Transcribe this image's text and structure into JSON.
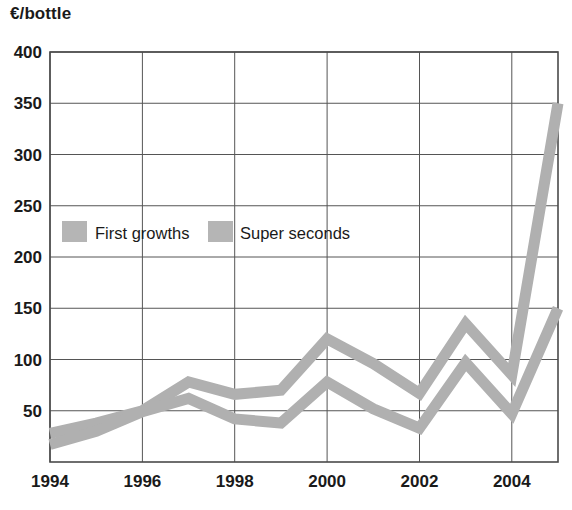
{
  "chart_data": {
    "type": "line",
    "title": "",
    "subtitle": "",
    "xlabel": "",
    "ylabel": "€/bottle",
    "ylabel_position": "top-left",
    "xlim": [
      1994,
      2005
    ],
    "ylim": [
      0,
      400
    ],
    "grid": true,
    "grid_axes": "both",
    "legend_position": "inside-upper-left",
    "x": [
      1994,
      1995,
      1996,
      1997,
      1998,
      1999,
      2000,
      2001,
      2002,
      2003,
      2004,
      2005
    ],
    "x_tick_labels": [
      "1994",
      "1996",
      "1998",
      "2000",
      "2002",
      "2004"
    ],
    "x_tick_values": [
      1994,
      1996,
      1998,
      2000,
      2002,
      2004
    ],
    "y_tick_labels": [
      "50",
      "100",
      "150",
      "200",
      "250",
      "300",
      "350",
      "400"
    ],
    "y_tick_values": [
      50,
      100,
      150,
      200,
      250,
      300,
      350,
      400
    ],
    "series": [
      {
        "name": "First growths",
        "color": "#b0b0b0",
        "style": "thick-band-line",
        "values": [
          28,
          38,
          50,
          78,
          66,
          70,
          120,
          96,
          67,
          135,
          85,
          350
        ]
      },
      {
        "name": "Super seconds",
        "color": "#b0b0b0",
        "style": "thick-band-line",
        "values": [
          17,
          30,
          49,
          62,
          42,
          38,
          78,
          52,
          33,
          97,
          47,
          150
        ]
      }
    ]
  },
  "legend": {
    "items": [
      {
        "label": "First growths",
        "swatch_color": "#b5b5b5"
      },
      {
        "label": "Super seconds",
        "swatch_color": "#b5b5b5"
      }
    ]
  },
  "axes": {
    "y_unit": "€/bottle",
    "y_ticks": [
      "400",
      "350",
      "300",
      "250",
      "200",
      "150",
      "100",
      "50"
    ],
    "x_ticks": [
      "1994",
      "1996",
      "1998",
      "2000",
      "2002",
      "2004"
    ]
  },
  "colors": {
    "series_gray": "#b0b0b0",
    "grid_line": "#555555",
    "plot_border": "#4a4a4a",
    "background": "#ffffff",
    "text": "#1a1a1a"
  }
}
